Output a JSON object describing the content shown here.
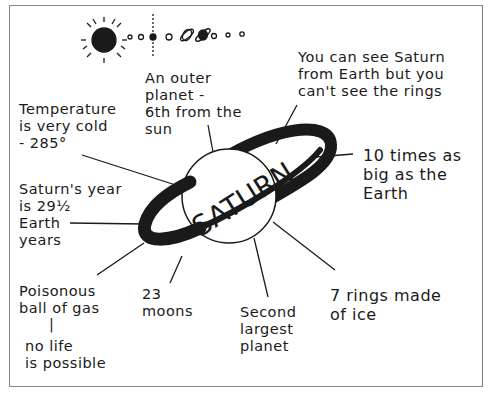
{
  "diagram": {
    "type": "concept-web",
    "center": "SATURN",
    "solar_system_strip": {
      "description": "sun followed by planets in a row, Saturn highlighted",
      "items": [
        "sun",
        "mercury",
        "venus",
        "earth",
        "mars",
        "jupiter",
        "saturn",
        "uranus",
        "neptune",
        "pluto"
      ]
    },
    "facts": [
      {
        "id": "outer",
        "text": "An outer\nplanet -\n6th from the\nsun"
      },
      {
        "id": "visible",
        "text": "You can see Saturn\nfrom Earth but you\ncan't see the rings"
      },
      {
        "id": "temperature",
        "text": "Temperature\nis very cold\n- 285°"
      },
      {
        "id": "size",
        "text": "10 times as\nbig as the\nEarth"
      },
      {
        "id": "year",
        "text": "Saturn's year\nis 29½\nEarth\nyears"
      },
      {
        "id": "gas",
        "text": "Poisonous\nball of gas"
      },
      {
        "id": "gas_sep",
        "text": "|"
      },
      {
        "id": "life",
        "text": "no life\nis possible"
      },
      {
        "id": "moons",
        "text": "23\nmoons"
      },
      {
        "id": "largest",
        "text": "Second\nlargest\nplanet"
      },
      {
        "id": "rings",
        "text": "7 rings made\nof ice"
      }
    ]
  },
  "colors": {
    "ink": "#1a1a1a",
    "frame": "#8a8a8a",
    "background": "#ffffff"
  }
}
